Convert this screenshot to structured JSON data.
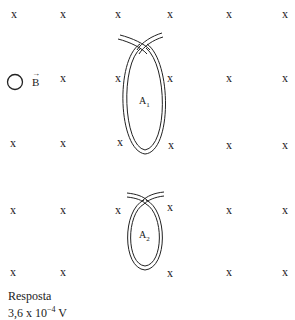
{
  "field": {
    "symbol": "B",
    "direction_marker": "x",
    "marks": [
      {
        "x": 14,
        "y": 14
      },
      {
        "x": 63,
        "y": 14
      },
      {
        "x": 118,
        "y": 14
      },
      {
        "x": 170,
        "y": 14
      },
      {
        "x": 229,
        "y": 14
      },
      {
        "x": 285,
        "y": 14
      },
      {
        "x": 63,
        "y": 78
      },
      {
        "x": 118,
        "y": 78
      },
      {
        "x": 170,
        "y": 78
      },
      {
        "x": 229,
        "y": 78
      },
      {
        "x": 285,
        "y": 78
      },
      {
        "x": 13,
        "y": 143
      },
      {
        "x": 63,
        "y": 143
      },
      {
        "x": 120,
        "y": 142
      },
      {
        "x": 171,
        "y": 145
      },
      {
        "x": 229,
        "y": 145
      },
      {
        "x": 285,
        "y": 145
      },
      {
        "x": 13,
        "y": 210
      },
      {
        "x": 63,
        "y": 210
      },
      {
        "x": 118,
        "y": 210
      },
      {
        "x": 170,
        "y": 207
      },
      {
        "x": 229,
        "y": 210
      },
      {
        "x": 285,
        "y": 210
      },
      {
        "x": 13,
        "y": 272
      },
      {
        "x": 63,
        "y": 272
      },
      {
        "x": 170,
        "y": 273
      },
      {
        "x": 229,
        "y": 272
      },
      {
        "x": 285,
        "y": 272
      }
    ]
  },
  "loops": [
    {
      "label": "A",
      "subscript": "1"
    },
    {
      "label": "A",
      "subscript": "2"
    }
  ],
  "answer": {
    "title": "Resposta",
    "value_prefix": "3,6 x 10",
    "exponent": "−4",
    "unit": " V"
  }
}
